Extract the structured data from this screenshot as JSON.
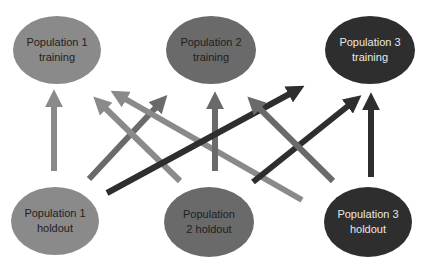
{
  "diagram": {
    "colors": {
      "population_1": "#8a8a8a",
      "population_2": "#6a6a6a",
      "population_3": "#2e2e2e",
      "background": "#ffffff"
    },
    "nodes": {
      "pop1_training": {
        "label": "Population 1\ntraining"
      },
      "pop2_training": {
        "label": "Population 2\ntraining"
      },
      "pop3_training": {
        "label": "Population 3\ntraining"
      },
      "pop1_holdout": {
        "label": "Population 1\nholdout"
      },
      "pop2_holdout": {
        "label": "Population\n2  holdout"
      },
      "pop3_holdout": {
        "label": "Population 3\nholdout"
      }
    },
    "edges": [
      {
        "from": "Population 1 holdout",
        "to": "Population 1 training"
      },
      {
        "from": "Population 1 holdout",
        "to": "Population 2 training"
      },
      {
        "from": "Population 1 holdout",
        "to": "Population 3 training"
      },
      {
        "from": "Population 2 holdout",
        "to": "Population 1 training"
      },
      {
        "from": "Population 2 holdout",
        "to": "Population 2 training"
      },
      {
        "from": "Population 2 holdout",
        "to": "Population 3 training"
      },
      {
        "from": "Population 3 holdout",
        "to": "Population 1 training"
      },
      {
        "from": "Population 3 holdout",
        "to": "Population 2 training"
      },
      {
        "from": "Population 3 holdout",
        "to": "Population 3 training"
      }
    ]
  }
}
